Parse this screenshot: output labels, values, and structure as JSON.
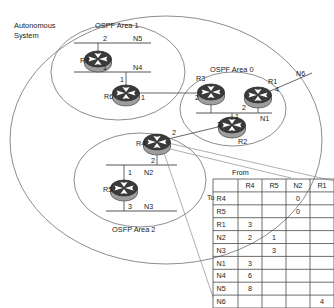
{
  "diagram": {
    "title_labels": {
      "autonomous_system_line1": "Autonomous",
      "autonomous_system_line2": "System",
      "area1": "OSPF Area 1",
      "area0": "OSPF Area 0",
      "area2": "OSFP Area 2"
    },
    "routers": [
      {
        "id": "R7",
        "label": "R7",
        "x": 98,
        "y": 60
      },
      {
        "id": "R6",
        "label": "R6",
        "x": 126,
        "y": 94
      },
      {
        "id": "R3",
        "label": "R3",
        "x": 211,
        "y": 93
      },
      {
        "id": "R1",
        "label": "R1",
        "x": 258,
        "y": 96
      },
      {
        "id": "R2",
        "label": "R2",
        "x": 232,
        "y": 126
      },
      {
        "id": "R4",
        "label": "R4",
        "x": 157,
        "y": 143
      },
      {
        "id": "R5",
        "label": "R5",
        "x": 124,
        "y": 189
      }
    ],
    "networks": [
      {
        "id": "N5",
        "label": "N5"
      },
      {
        "id": "N4",
        "label": "N4"
      },
      {
        "id": "N1",
        "label": "N1"
      },
      {
        "id": "N6",
        "label": "N6"
      },
      {
        "id": "N2",
        "label": "N2"
      },
      {
        "id": "N3",
        "label": "N3"
      }
    ],
    "interface_costs": [
      {
        "router": "R7",
        "port": "2",
        "toward": "N5"
      },
      {
        "router": "R7",
        "port": "1",
        "toward": "N4"
      },
      {
        "router": "R6",
        "port": "1",
        "toward": "N4"
      },
      {
        "router": "R6",
        "port": "1",
        "toward": "R3"
      },
      {
        "router": "R3",
        "port": "2",
        "toward": "N1"
      },
      {
        "router": "R1",
        "port": "2",
        "toward": "N1"
      },
      {
        "router": "R1",
        "port": "4",
        "toward": "N6"
      },
      {
        "router": "R2",
        "port": "3",
        "toward": "N1"
      },
      {
        "router": "R2",
        "port": "1",
        "toward": "N1bus"
      },
      {
        "router": "R4",
        "port": "2",
        "toward": "R3area0"
      },
      {
        "router": "R4",
        "port": "2",
        "toward": "N2"
      },
      {
        "router": "R5",
        "port": "1",
        "toward": "N2"
      },
      {
        "router": "R5",
        "port": "3",
        "toward": "N3"
      }
    ],
    "edge_numbers": {
      "r7_top": "2",
      "r7_bottom": "1",
      "r6_top": "1",
      "r6_right": "1",
      "r3_left": "2",
      "r1_left": "2",
      "r1_right": "4",
      "r2_left": "3",
      "r2_top": "1",
      "r4_right": "2",
      "r4_bottom": "2",
      "r5_left": "1",
      "r5_bottom": "3"
    }
  },
  "table": {
    "from_label": "From",
    "to_label": "To",
    "columns": [
      "R4",
      "R5",
      "N2",
      "R1"
    ],
    "rows": [
      {
        "header": "R4",
        "cells": [
          "",
          "",
          "0",
          ""
        ]
      },
      {
        "header": "R5",
        "cells": [
          "",
          "",
          "0",
          ""
        ]
      },
      {
        "header": "R1",
        "cells": [
          "3",
          "",
          "",
          ""
        ]
      },
      {
        "header": "N2",
        "cells": [
          "2",
          "1",
          "",
          ""
        ]
      },
      {
        "header": "N3",
        "cells": [
          "",
          "3",
          "",
          ""
        ]
      },
      {
        "header": "N1",
        "cells": [
          "3",
          "",
          "",
          ""
        ]
      },
      {
        "header": "N4",
        "cells": [
          "6",
          "",
          "",
          ""
        ]
      },
      {
        "header": "N5",
        "cells": [
          "8",
          "",
          "",
          ""
        ]
      },
      {
        "header": "N6",
        "cells": [
          "",
          "",
          "",
          "4"
        ]
      }
    ]
  },
  "colors": {
    "router_body": "#3a3a3a",
    "router_base": "#9a9a9a",
    "line": "#555555",
    "ellipse": "#6e6e6e",
    "text": "#1a1a1a",
    "background": "#ffffff"
  }
}
